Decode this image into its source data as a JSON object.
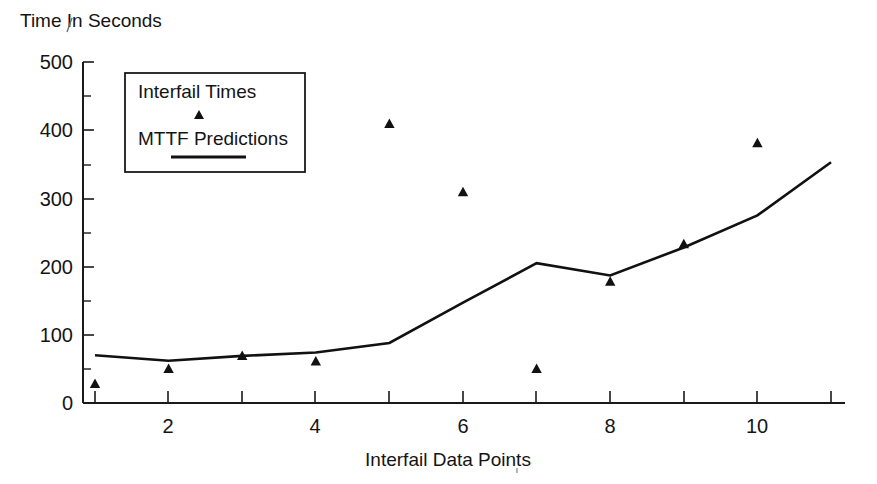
{
  "chart_data": {
    "type": "line",
    "title": "Time In Seconds",
    "xlabel": "Interfail Data Points",
    "ylabel": "Time In Seconds",
    "x": [
      1,
      2,
      3,
      4,
      5,
      6,
      7,
      8,
      9,
      10,
      11
    ],
    "xlim": [
      1,
      11
    ],
    "ylim": [
      0,
      500
    ],
    "grid": false,
    "legend_position": "top-left-inside",
    "x_tick_values": [
      1,
      2,
      3,
      4,
      5,
      6,
      7,
      8,
      9,
      10,
      11
    ],
    "x_tick_labels": [
      "",
      "2",
      "",
      "4",
      "",
      "6",
      "",
      "8",
      "",
      "10",
      ""
    ],
    "y_tick_values": [
      0,
      100,
      200,
      300,
      400,
      500
    ],
    "y_tick_labels": [
      "0",
      "100",
      "200",
      "300",
      "400",
      "500"
    ],
    "y_minor_tick_values": [
      50,
      150,
      250,
      350,
      450
    ],
    "series": [
      {
        "name": "Interfail Times",
        "marker": "triangle",
        "style": "markers",
        "color": "#111111",
        "x": [
          1,
          2,
          3,
          4,
          5,
          6,
          7,
          8,
          9,
          10
        ],
        "values": [
          29,
          51,
          70,
          62,
          410,
          310,
          51,
          179,
          234,
          382
        ]
      },
      {
        "name": "MTTF Predictions",
        "marker": "none",
        "style": "line",
        "color": "#111111",
        "x": [
          1,
          2,
          3,
          4,
          5,
          6,
          7,
          8,
          9,
          10,
          11
        ],
        "values": [
          70,
          62,
          69,
          74,
          88,
          147,
          205,
          187,
          228,
          275,
          353
        ]
      }
    ]
  },
  "legend": {
    "entries": [
      {
        "label": "Interfail Times",
        "symbol": "triangle-marker"
      },
      {
        "label": "MTTF Predictions",
        "symbol": "line-swatch"
      }
    ]
  },
  "axes": {
    "y_title": "Time In Seconds",
    "x_title": "Interfail Data Points"
  }
}
